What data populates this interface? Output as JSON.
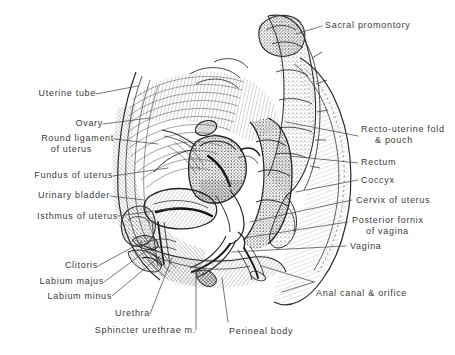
{
  "figure": {
    "ink_color": "#2b2b2b",
    "background_color": "#ffffff"
  },
  "labels": {
    "uterine_tube": "Uterine tube",
    "ovary": "Ovary",
    "round_ligament_1": "Round ligament",
    "round_ligament_2": "of  uterus",
    "fundus_of_uterus": "Fundus of uterus",
    "urinary_bladder": "Urinary  bladder",
    "isthmus_of_uterus": "Isthmus  of uterus",
    "clitoris": "Clitoris",
    "labium_majus": "Labium  majus",
    "labium_minus": "Labium  minus",
    "urethra": "Urethra",
    "sphincter_urethrae": "Sphincter urethrae  m.",
    "perineal_body": "Perineal  body",
    "sacral_promontory": "Sacral promontory",
    "recto_uterine_1": "Recto-uterine fold",
    "recto_uterine_2": "& pouch",
    "rectum": "Rectum",
    "coccyx": "Coccyx",
    "cervix_of_uterus": "Cervix  of uterus",
    "posterior_fornix_1": "Posterior  fornix",
    "posterior_fornix_2": "of vagina",
    "vagina": "Vagina",
    "anal_canal": "Anal  canal  &  orifice"
  }
}
